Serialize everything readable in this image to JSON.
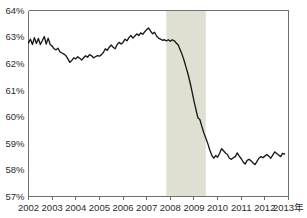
{
  "chart_data": {
    "type": "line",
    "title": "",
    "subtitle": "",
    "xlabel": "",
    "ylabel": "",
    "xlim": [
      2002.0,
      2013.0
    ],
    "ylim": [
      57,
      64
    ],
    "grid": false,
    "legend": null,
    "y_tick_labels": [
      "64%",
      "63%",
      "62%",
      "61%",
      "60%",
      "59%",
      "58%",
      "57%"
    ],
    "y_ticks": [
      64,
      63,
      62,
      61,
      60,
      59,
      58,
      57
    ],
    "x_tick_labels": [
      "2002",
      "2003",
      "2004",
      "2005",
      "2006",
      "2007",
      "2008",
      "2009",
      "2010",
      "2011",
      "2012",
      "2013年"
    ],
    "x_ticks": [
      2002,
      2003,
      2004,
      2005,
      2006,
      2007,
      2008,
      2009,
      2010,
      2011,
      2012,
      2013
    ],
    "axis_unit_suffix": "年",
    "colors": {
      "line": "#1a1a1a",
      "axis": "#6f6f6f",
      "text": "#2b2b2b",
      "shaded_band": "#dfe0d2",
      "background": "#ffffff"
    },
    "shaded_bands": [
      {
        "name": "recession-band",
        "x_start": 2007.83,
        "x_end": 2009.5,
        "color": "#dfe0d2"
      }
    ],
    "series": [
      {
        "name": "labor-force-participation-rate",
        "x": [
          2002.0,
          2002.083,
          2002.167,
          2002.25,
          2002.333,
          2002.417,
          2002.5,
          2002.583,
          2002.667,
          2002.75,
          2002.833,
          2002.917,
          2003.0,
          2003.083,
          2003.167,
          2003.25,
          2003.333,
          2003.417,
          2003.5,
          2003.583,
          2003.667,
          2003.75,
          2003.833,
          2003.917,
          2004.0,
          2004.083,
          2004.167,
          2004.25,
          2004.333,
          2004.417,
          2004.5,
          2004.583,
          2004.667,
          2004.75,
          2004.833,
          2004.917,
          2005.0,
          2005.083,
          2005.167,
          2005.25,
          2005.333,
          2005.417,
          2005.5,
          2005.583,
          2005.667,
          2005.75,
          2005.833,
          2005.917,
          2006.0,
          2006.083,
          2006.167,
          2006.25,
          2006.333,
          2006.417,
          2006.5,
          2006.583,
          2006.667,
          2006.75,
          2006.833,
          2006.917,
          2007.0,
          2007.083,
          2007.167,
          2007.25,
          2007.333,
          2007.417,
          2007.5,
          2007.583,
          2007.667,
          2007.75,
          2007.833,
          2007.917,
          2008.0,
          2008.083,
          2008.167,
          2008.25,
          2008.333,
          2008.417,
          2008.5,
          2008.583,
          2008.667,
          2008.75,
          2008.833,
          2008.917,
          2009.0,
          2009.083,
          2009.167,
          2009.25,
          2009.333,
          2009.417,
          2009.5,
          2009.583,
          2009.667,
          2009.75,
          2009.833,
          2009.917,
          2010.0,
          2010.083,
          2010.167,
          2010.25,
          2010.333,
          2010.417,
          2010.5,
          2010.583,
          2010.667,
          2010.75,
          2010.833,
          2010.917,
          2011.0,
          2011.083,
          2011.167,
          2011.25,
          2011.333,
          2011.417,
          2011.5,
          2011.583,
          2011.667,
          2011.75,
          2011.833,
          2011.917,
          2012.0,
          2012.083,
          2012.167,
          2012.25,
          2012.333,
          2012.417,
          2012.5,
          2012.583,
          2012.667,
          2012.75,
          2012.833
        ],
        "values": [
          62.78,
          62.92,
          62.72,
          62.98,
          62.76,
          62.95,
          62.72,
          62.86,
          63.02,
          62.74,
          62.96,
          62.72,
          62.66,
          62.56,
          62.52,
          62.58,
          62.44,
          62.4,
          62.36,
          62.3,
          62.18,
          62.05,
          62.12,
          62.22,
          62.18,
          62.26,
          62.2,
          62.14,
          62.22,
          62.3,
          62.24,
          62.34,
          62.3,
          62.22,
          62.26,
          62.3,
          62.28,
          62.34,
          62.42,
          62.56,
          62.5,
          62.62,
          62.7,
          62.62,
          62.56,
          62.72,
          62.8,
          62.74,
          62.8,
          62.92,
          62.86,
          62.98,
          63.06,
          62.96,
          63.04,
          63.12,
          63.06,
          63.16,
          63.1,
          63.2,
          63.28,
          63.34,
          63.22,
          63.12,
          63.18,
          63.04,
          62.96,
          62.92,
          62.88,
          62.9,
          62.86,
          62.9,
          62.84,
          62.9,
          62.86,
          62.78,
          62.7,
          62.52,
          62.34,
          62.12,
          61.86,
          61.6,
          61.3,
          60.96,
          60.6,
          60.28,
          59.96,
          59.9,
          59.64,
          59.4,
          59.2,
          59.0,
          58.76,
          58.56,
          58.44,
          58.54,
          58.48,
          58.62,
          58.8,
          58.72,
          58.64,
          58.58,
          58.44,
          58.4,
          58.46,
          58.5,
          58.64,
          58.52,
          58.42,
          58.3,
          58.22,
          58.36,
          58.4,
          58.34,
          58.26,
          58.2,
          58.32,
          58.44,
          58.5,
          58.46,
          58.52,
          58.58,
          58.52,
          58.44,
          58.56,
          58.68,
          58.62,
          58.56,
          58.5,
          58.62,
          58.6
        ]
      }
    ]
  }
}
